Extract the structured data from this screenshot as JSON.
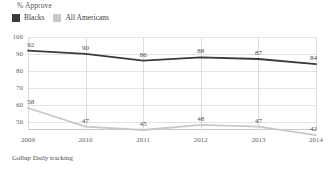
{
  "header": {
    "axis_title": "% Approve"
  },
  "legend": {
    "position": "top-left",
    "items": [
      {
        "label": "Blacks",
        "color": "#3a3a3a"
      },
      {
        "label": "All Americans",
        "color": "#c8c8c8"
      }
    ]
  },
  "source_note": "Gallup Daily tracking",
  "chart_data": {
    "type": "line",
    "title": "% Approve",
    "xlabel": "",
    "ylabel": "% Approve",
    "categories": [
      "2009",
      "2010",
      "2011",
      "2012",
      "2013",
      "2014"
    ],
    "x": [
      2009,
      2010,
      2011,
      2012,
      2013,
      2014
    ],
    "ylim": [
      45,
      100
    ],
    "yticks": [
      50,
      60,
      70,
      80,
      90,
      100
    ],
    "ytick_labels": [
      "50",
      "60",
      "70",
      "80",
      "90",
      "100"
    ],
    "grid": true,
    "legend_position": "top-left",
    "series": [
      {
        "name": "Blacks",
        "color": "#3a3a3a",
        "values": [
          92,
          90,
          86,
          88,
          87,
          84
        ],
        "labels": [
          "92",
          "90",
          "86",
          "88",
          "87",
          "84"
        ]
      },
      {
        "name": "All Americans",
        "color": "#c8c8c8",
        "values": [
          58,
          47,
          45,
          48,
          47,
          42
        ],
        "labels": [
          "58",
          "47",
          "45",
          "48",
          "47",
          "42"
        ]
      }
    ],
    "source": "Gallup Daily tracking"
  }
}
